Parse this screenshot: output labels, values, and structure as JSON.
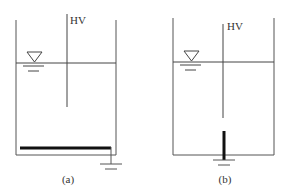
{
  "diagrams": [
    {
      "id": "a",
      "caption": "(a)",
      "electrode_label": "HV",
      "description": "Tank with HV electrode above water; grounded horizontal plate at the bottom"
    },
    {
      "id": "b",
      "caption": "(b)",
      "electrode_label": "HV",
      "description": "Tank with HV electrode above water; grounded vertical rod electrode at the bottom"
    }
  ],
  "colors": {
    "line": "#555555",
    "thick": "#111111",
    "text": "#333333",
    "background": "#ffffff"
  },
  "icons": {
    "water_level": "water-level-triangle-icon",
    "ground": "ground-symbol-icon"
  }
}
